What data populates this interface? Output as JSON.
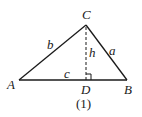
{
  "diagram": {
    "caption": "(1)",
    "vertices": {
      "A": {
        "label": "A",
        "x": 19,
        "y": 80
      },
      "B": {
        "label": "B",
        "x": 127,
        "y": 80
      },
      "C": {
        "label": "C",
        "x": 86,
        "y": 25
      },
      "D": {
        "label": "D",
        "x": 86,
        "y": 80
      }
    },
    "sides": {
      "a": {
        "label": "a",
        "from": "C",
        "to": "B"
      },
      "b": {
        "label": "b",
        "from": "A",
        "to": "C"
      },
      "c": {
        "label": "c",
        "from": "A",
        "to": "B"
      }
    },
    "altitude": {
      "label": "h",
      "from": "C",
      "to": "D",
      "style": "dashed"
    },
    "right_angle_marker": {
      "at": "D"
    },
    "colors": {
      "stroke": "#1a1a1a",
      "background": "#ffffff"
    }
  }
}
